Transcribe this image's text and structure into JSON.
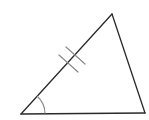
{
  "diagram": {
    "type": "triangle",
    "background": "#ffffff",
    "stroke_color": "#2a2a2a",
    "mark_color": "#8a8a8a",
    "vertices": {
      "top": [
        112,
        14
      ],
      "bottom_left": [
        21,
        114
      ],
      "bottom_right": [
        145,
        113
      ]
    },
    "side_marks": {
      "side": "bottom_left-top",
      "count": 2,
      "description": "double tick marks indicating congruent side"
    },
    "angle_marks": {
      "vertex": "bottom_left",
      "count": 1,
      "description": "single arc indicating marked angle"
    },
    "labels": []
  }
}
